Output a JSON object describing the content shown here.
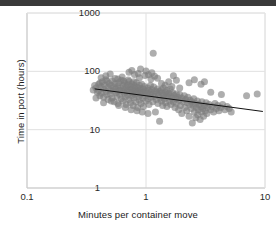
{
  "chart_data": {
    "type": "scatter",
    "title": "",
    "subtitle": "",
    "xlabel": "Minutes per container move",
    "ylabel": "Time in port (hours)",
    "xscale": "log",
    "yscale": "log",
    "xlim": [
      0.1,
      10
    ],
    "ylim": [
      1,
      1000
    ],
    "xticks": [
      "0.1",
      "1",
      "10"
    ],
    "xtick_values": [
      0.1,
      1,
      10
    ],
    "yticks": [
      "1",
      "10",
      "100",
      "1000"
    ],
    "ytick_values": [
      1,
      10,
      100,
      1000
    ],
    "grid": true,
    "legend": "none",
    "marker": {
      "shape": "circle",
      "color": "#7d7d7d",
      "opacity": 0.62,
      "size_px": 7
    },
    "trendline": {
      "type": "linear-on-log-log",
      "color": "#111111",
      "width_px": 1,
      "x_start": 0.37,
      "y_start": 50,
      "x_end": 9.6,
      "y_end": 20.5
    },
    "points": [
      [
        0.38,
        52
      ],
      [
        0.39,
        44
      ],
      [
        0.4,
        60
      ],
      [
        0.4,
        47
      ],
      [
        0.41,
        38
      ],
      [
        0.42,
        55
      ],
      [
        0.42,
        42
      ],
      [
        0.43,
        66
      ],
      [
        0.44,
        50
      ],
      [
        0.44,
        36
      ],
      [
        0.45,
        58
      ],
      [
        0.46,
        45
      ],
      [
        0.46,
        72
      ],
      [
        0.47,
        40
      ],
      [
        0.48,
        54
      ],
      [
        0.48,
        33
      ],
      [
        0.49,
        62
      ],
      [
        0.5,
        48
      ],
      [
        0.5,
        41
      ],
      [
        0.51,
        57
      ],
      [
        0.52,
        35
      ],
      [
        0.52,
        68
      ],
      [
        0.53,
        46
      ],
      [
        0.54,
        53
      ],
      [
        0.54,
        30
      ],
      [
        0.55,
        61
      ],
      [
        0.56,
        43
      ],
      [
        0.56,
        50
      ],
      [
        0.57,
        37
      ],
      [
        0.58,
        56
      ],
      [
        0.58,
        28
      ],
      [
        0.59,
        64
      ],
      [
        0.6,
        47
      ],
      [
        0.6,
        40
      ],
      [
        0.61,
        52
      ],
      [
        0.62,
        34
      ],
      [
        0.62,
        70
      ],
      [
        0.63,
        45
      ],
      [
        0.64,
        58
      ],
      [
        0.64,
        31
      ],
      [
        0.65,
        49
      ],
      [
        0.66,
        42
      ],
      [
        0.66,
        63
      ],
      [
        0.67,
        36
      ],
      [
        0.68,
        54
      ],
      [
        0.68,
        27
      ],
      [
        0.69,
        46
      ],
      [
        0.7,
        59
      ],
      [
        0.7,
        39
      ],
      [
        0.71,
        50
      ],
      [
        0.72,
        33
      ],
      [
        0.72,
        67
      ],
      [
        0.73,
        44
      ],
      [
        0.74,
        55
      ],
      [
        0.74,
        29
      ],
      [
        0.75,
        48
      ],
      [
        0.76,
        38
      ],
      [
        0.76,
        61
      ],
      [
        0.77,
        43
      ],
      [
        0.78,
        52
      ],
      [
        0.78,
        26
      ],
      [
        0.79,
        35
      ],
      [
        0.8,
        57
      ],
      [
        0.8,
        46
      ],
      [
        0.81,
        40
      ],
      [
        0.82,
        49
      ],
      [
        0.82,
        30
      ],
      [
        0.83,
        64
      ],
      [
        0.84,
        42
      ],
      [
        0.85,
        53
      ],
      [
        0.85,
        24
      ],
      [
        0.86,
        45
      ],
      [
        0.87,
        37
      ],
      [
        0.88,
        58
      ],
      [
        0.88,
        32
      ],
      [
        0.89,
        47
      ],
      [
        0.9,
        41
      ],
      [
        0.9,
        51
      ],
      [
        0.91,
        28
      ],
      [
        0.92,
        60
      ],
      [
        0.93,
        44
      ],
      [
        0.94,
        35
      ],
      [
        0.95,
        50
      ],
      [
        0.95,
        25
      ],
      [
        0.96,
        43
      ],
      [
        0.97,
        55
      ],
      [
        0.98,
        38
      ],
      [
        0.99,
        46
      ],
      [
        1.0,
        31
      ],
      [
        1.0,
        101
      ],
      [
        1.02,
        42
      ],
      [
        1.03,
        52
      ],
      [
        1.04,
        34
      ],
      [
        1.05,
        47
      ],
      [
        1.06,
        27
      ],
      [
        1.08,
        40
      ],
      [
        1.09,
        58
      ],
      [
        1.1,
        44
      ],
      [
        1.1,
        36
      ],
      [
        1.12,
        49
      ],
      [
        1.14,
        30
      ],
      [
        1.15,
        41
      ],
      [
        1.16,
        54
      ],
      [
        1.18,
        37
      ],
      [
        1.2,
        46
      ],
      [
        1.2,
        20
      ],
      [
        1.22,
        33
      ],
      [
        1.24,
        43
      ],
      [
        1.25,
        50
      ],
      [
        1.26,
        28
      ],
      [
        1.28,
        39
      ],
      [
        1.3,
        45
      ],
      [
        1.3,
        14
      ],
      [
        1.32,
        35
      ],
      [
        1.34,
        48
      ],
      [
        1.35,
        31
      ],
      [
        1.36,
        42
      ],
      [
        1.38,
        26
      ],
      [
        1.4,
        38
      ],
      [
        1.4,
        52
      ],
      [
        1.42,
        34
      ],
      [
        1.45,
        44
      ],
      [
        1.46,
        29
      ],
      [
        1.48,
        40
      ],
      [
        1.5,
        47
      ],
      [
        1.5,
        25
      ],
      [
        1.52,
        36
      ],
      [
        1.55,
        42
      ],
      [
        1.58,
        31
      ],
      [
        1.6,
        38
      ],
      [
        1.6,
        50
      ],
      [
        1.62,
        27
      ],
      [
        1.65,
        35
      ],
      [
        1.68,
        43
      ],
      [
        1.7,
        30
      ],
      [
        1.72,
        39
      ],
      [
        1.75,
        24
      ],
      [
        1.78,
        34
      ],
      [
        1.8,
        41
      ],
      [
        1.8,
        28
      ],
      [
        1.85,
        36
      ],
      [
        1.88,
        22
      ],
      [
        1.9,
        32
      ],
      [
        1.92,
        40
      ],
      [
        1.95,
        26
      ],
      [
        2.0,
        35
      ],
      [
        2.0,
        19
      ],
      [
        2.05,
        30
      ],
      [
        2.1,
        38
      ],
      [
        2.12,
        24
      ],
      [
        2.15,
        33
      ],
      [
        2.2,
        21
      ],
      [
        2.22,
        29
      ],
      [
        2.25,
        36
      ],
      [
        2.3,
        17
      ],
      [
        2.32,
        27
      ],
      [
        2.35,
        32
      ],
      [
        2.4,
        23
      ],
      [
        2.42,
        30
      ],
      [
        2.45,
        13
      ],
      [
        2.5,
        26
      ],
      [
        2.52,
        34
      ],
      [
        2.55,
        20
      ],
      [
        2.6,
        28
      ],
      [
        2.62,
        16
      ],
      [
        2.65,
        24
      ],
      [
        2.7,
        31
      ],
      [
        2.72,
        18
      ],
      [
        2.75,
        22
      ],
      [
        2.8,
        27
      ],
      [
        2.85,
        15
      ],
      [
        2.9,
        25
      ],
      [
        2.92,
        20
      ],
      [
        2.95,
        30
      ],
      [
        3.0,
        23
      ],
      [
        3.05,
        17
      ],
      [
        3.1,
        26
      ],
      [
        3.15,
        21
      ],
      [
        3.2,
        29
      ],
      [
        3.25,
        19
      ],
      [
        3.3,
        24
      ],
      [
        3.4,
        27
      ],
      [
        3.5,
        22
      ],
      [
        3.6,
        25
      ],
      [
        3.7,
        20
      ],
      [
        3.8,
        28
      ],
      [
        3.9,
        23
      ],
      [
        4.0,
        26
      ],
      [
        4.1,
        21
      ],
      [
        4.25,
        24
      ],
      [
        4.4,
        27
      ],
      [
        4.6,
        22
      ],
      [
        4.8,
        25
      ],
      [
        5.0,
        23
      ],
      [
        5.2,
        20
      ],
      [
        0.36,
        48
      ],
      [
        0.37,
        57
      ],
      [
        0.38,
        35
      ],
      [
        0.41,
        63
      ],
      [
        0.44,
        29
      ],
      [
        0.47,
        68
      ],
      [
        0.51,
        31
      ],
      [
        0.55,
        75
      ],
      [
        0.59,
        26
      ],
      [
        0.63,
        80
      ],
      [
        0.67,
        24
      ],
      [
        0.71,
        71
      ],
      [
        0.75,
        22
      ],
      [
        0.79,
        66
      ],
      [
        0.84,
        21
      ],
      [
        0.88,
        78
      ],
      [
        0.93,
        20
      ],
      [
        0.98,
        85
      ],
      [
        1.04,
        19
      ],
      [
        1.1,
        74
      ],
      [
        0.72,
        96
      ],
      [
        0.76,
        103
      ],
      [
        0.8,
        88
      ],
      [
        0.86,
        92
      ],
      [
        0.9,
        110
      ],
      [
        1.05,
        87
      ],
      [
        1.12,
        95
      ],
      [
        1.18,
        82
      ],
      [
        1.25,
        76
      ],
      [
        1.15,
        205
      ],
      [
        1.7,
        84
      ],
      [
        1.8,
        70
      ],
      [
        2.3,
        64
      ],
      [
        2.55,
        72
      ],
      [
        2.9,
        60
      ],
      [
        3.1,
        66
      ],
      [
        3.5,
        44
      ],
      [
        4.3,
        40
      ],
      [
        7.0,
        38
      ],
      [
        8.6,
        41
      ],
      [
        0.42,
        78
      ],
      [
        0.46,
        84
      ],
      [
        0.5,
        90
      ],
      [
        0.58,
        74
      ],
      [
        0.65,
        68
      ],
      [
        1.35,
        62
      ],
      [
        1.45,
        58
      ],
      [
        1.55,
        66
      ],
      [
        1.65,
        55
      ],
      [
        1.92,
        52
      ]
    ]
  }
}
